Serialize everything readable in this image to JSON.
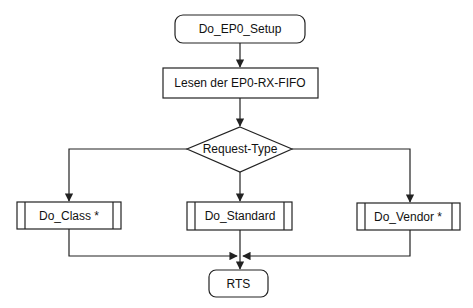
{
  "diagram": {
    "type": "flowchart",
    "colors": {
      "background": "#ffffff",
      "stroke": "#222222",
      "text": "#111111"
    },
    "nodes": {
      "start": {
        "label": "Do_EP0_Setup",
        "shape": "terminator"
      },
      "read_fifo": {
        "label": "Lesen der EP0-RX-FIFO",
        "shape": "process"
      },
      "decision": {
        "label": "Request-Type",
        "shape": "decision"
      },
      "do_class": {
        "label": "Do_Class *",
        "shape": "subroutine"
      },
      "do_standard": {
        "label": "Do_Standard",
        "shape": "subroutine"
      },
      "do_vendor": {
        "label": "Do_Vendor *",
        "shape": "subroutine"
      },
      "end": {
        "label": "RTS",
        "shape": "terminator"
      }
    },
    "edges": [
      {
        "from": "start",
        "to": "read_fifo"
      },
      {
        "from": "read_fifo",
        "to": "decision"
      },
      {
        "from": "decision",
        "to": "do_class"
      },
      {
        "from": "decision",
        "to": "do_standard"
      },
      {
        "from": "decision",
        "to": "do_vendor"
      },
      {
        "from": "do_class",
        "to": "end"
      },
      {
        "from": "do_standard",
        "to": "end"
      },
      {
        "from": "do_vendor",
        "to": "end"
      }
    ]
  }
}
